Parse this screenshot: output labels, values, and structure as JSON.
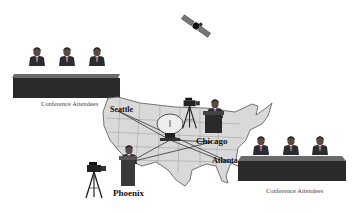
{
  "cities": [
    {
      "name": "Seattle"
    },
    {
      "name": "Chicago"
    },
    {
      "name": "Atlanta"
    },
    {
      "name": "Phoenix"
    }
  ],
  "captions": {
    "left_group": "Conference Attendees",
    "right_group": "Conference Attendees"
  },
  "elements": {
    "satellite": "satellite-icon",
    "dish": "satellite-dish-icon",
    "camera_left": "video-camera-tripod-icon",
    "camera_center": "video-camera-tripod-icon",
    "presenters": "podium-speaker-icon"
  },
  "colors": {
    "map_fill": "#d9d9d9",
    "map_stroke": "#555555",
    "table": "#2a2a2a",
    "table_top": "#6a6a6a",
    "line": "#333333"
  }
}
